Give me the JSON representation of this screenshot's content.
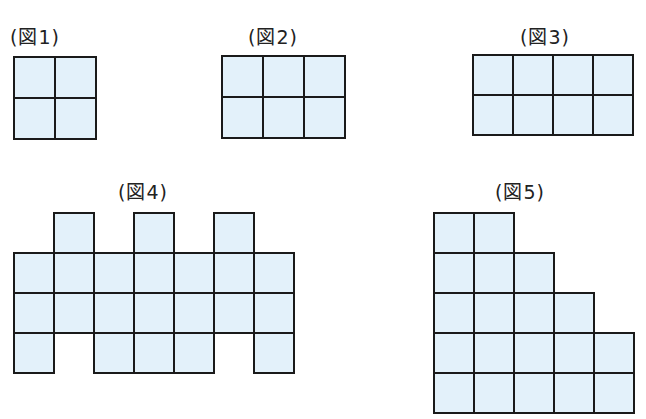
{
  "colors": {
    "cell_fill": "#e3f1fa",
    "line": "#1a1a1a"
  },
  "figures": [
    {
      "label": "(図1)",
      "label_x": 10,
      "label_y": 22,
      "x": 14,
      "y": 57,
      "cell": 41,
      "cols": 2,
      "rows": 2,
      "cells": [
        [
          0,
          0
        ],
        [
          1,
          0
        ],
        [
          0,
          1
        ],
        [
          1,
          1
        ]
      ]
    },
    {
      "label": "(図2)",
      "label_x": 248,
      "label_y": 22,
      "x": 222,
      "y": 56,
      "cell": 41,
      "cols": 3,
      "rows": 2,
      "cells": [
        [
          0,
          0
        ],
        [
          1,
          0
        ],
        [
          2,
          0
        ],
        [
          0,
          1
        ],
        [
          1,
          1
        ],
        [
          2,
          1
        ]
      ]
    },
    {
      "label": "(図3)",
      "label_x": 520,
      "label_y": 22,
      "x": 473,
      "y": 55,
      "cell": 40,
      "cols": 4,
      "rows": 2,
      "cells": [
        [
          0,
          0
        ],
        [
          1,
          0
        ],
        [
          2,
          0
        ],
        [
          3,
          0
        ],
        [
          0,
          1
        ],
        [
          1,
          1
        ],
        [
          2,
          1
        ],
        [
          3,
          1
        ]
      ]
    },
    {
      "label": "(図4)",
      "label_x": 118,
      "label_y": 177,
      "x": 14,
      "y": 213,
      "cell": 40,
      "cols": 7,
      "rows": 4,
      "cells": [
        [
          1,
          0
        ],
        [
          3,
          0
        ],
        [
          5,
          0
        ],
        [
          0,
          1
        ],
        [
          1,
          1
        ],
        [
          2,
          1
        ],
        [
          3,
          1
        ],
        [
          4,
          1
        ],
        [
          5,
          1
        ],
        [
          6,
          1
        ],
        [
          0,
          2
        ],
        [
          1,
          2
        ],
        [
          2,
          2
        ],
        [
          3,
          2
        ],
        [
          4,
          2
        ],
        [
          5,
          2
        ],
        [
          6,
          2
        ],
        [
          0,
          3
        ],
        [
          2,
          3
        ],
        [
          3,
          3
        ],
        [
          4,
          3
        ],
        [
          6,
          3
        ]
      ]
    },
    {
      "label": "(図5)",
      "label_x": 495,
      "label_y": 177,
      "x": 434,
      "y": 213,
      "cell": 40,
      "cols": 5,
      "rows": 5,
      "cells": [
        [
          0,
          0
        ],
        [
          1,
          0
        ],
        [
          0,
          1
        ],
        [
          1,
          1
        ],
        [
          2,
          1
        ],
        [
          0,
          2
        ],
        [
          1,
          2
        ],
        [
          2,
          2
        ],
        [
          3,
          2
        ],
        [
          0,
          3
        ],
        [
          1,
          3
        ],
        [
          2,
          3
        ],
        [
          3,
          3
        ],
        [
          4,
          3
        ],
        [
          0,
          4
        ],
        [
          1,
          4
        ],
        [
          2,
          4
        ],
        [
          3,
          4
        ],
        [
          4,
          4
        ]
      ]
    }
  ]
}
